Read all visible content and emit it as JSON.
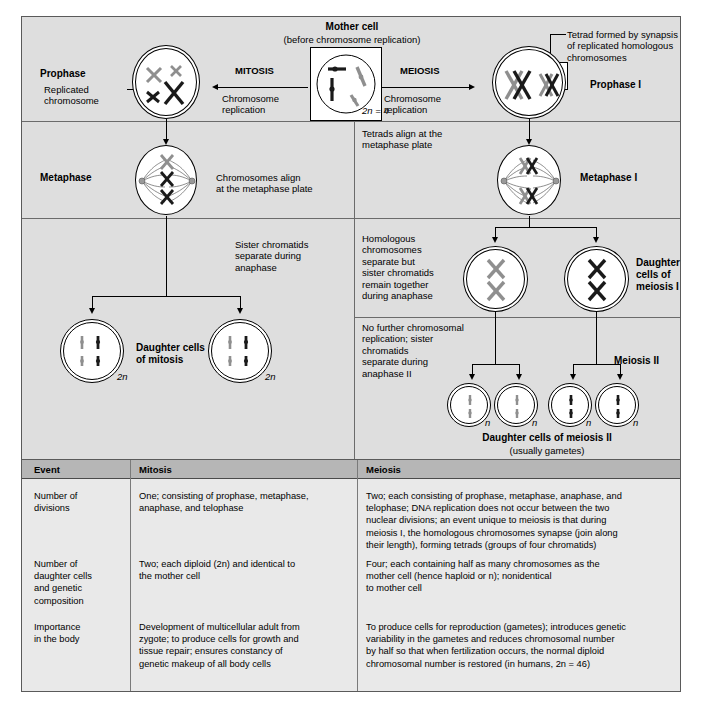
{
  "figure": {
    "mother_cell": {
      "title": "Mother cell",
      "subtitle": "(before chromosome replication)",
      "ploidy": "2n = 4"
    },
    "mitosis_branch": {
      "arrow_label": "MITOSIS",
      "sub_label": "Chromosome\nreplication"
    },
    "meiosis_branch": {
      "arrow_label": "MEIOSIS",
      "sub_label": "Chromosome\nreplication"
    },
    "row1": {
      "left_stage": "Prophase",
      "left_callout": "Replicated\nchromosome",
      "right_stage": "Prophase I",
      "right_callout": "Tetrad formed by synapsis\nof replicated homologous\nchromosomes"
    },
    "row2": {
      "left_stage": "Metaphase",
      "left_note": "Chromosomes align\nat the metaphase plate",
      "right_note": "Tetrads align at the\nmetaphase plate",
      "right_stage": "Metaphase I"
    },
    "row3": {
      "left_note": "Sister chromatids\nseparate during\nanaphase",
      "left_result": "Daughter cells\nof mitosis",
      "left_ploidy_a": "2n",
      "left_ploidy_b": "2n",
      "right_note": "Homologous\nchromosomes\nseparate but\nsister chromatids\nremain together\nduring anaphase",
      "right_result": "Daughter\ncells of\nmeiosis I"
    },
    "row4": {
      "right_note": "No further chromosomal\nreplication; sister\nchromatids\nseparate during\nanaphase II",
      "right_stage": "Meiosis II",
      "result_title": "Daughter cells of meiosis II",
      "result_subtitle": "(usually gametes)",
      "ploidies": [
        "n",
        "n",
        "n",
        "n"
      ]
    }
  },
  "table": {
    "headers": [
      "Event",
      "Mitosis",
      "Meiosis"
    ],
    "rows": [
      {
        "event": "Number of\ndivisions",
        "mitosis": "One; consisting of prophase, metaphase,\nanaphase, and telophase",
        "meiosis": "Two; each consisting of prophase, metaphase, anaphase, and\ntelophase; DNA replication does not occur between the two\nnuclear divisions; an event unique to meiosis is that during\nmeiosis I, the homologous chromosomes synapse (join along\ntheir length), forming tetrads (groups of four chromatids)"
      },
      {
        "event": "Number of\ndaughter cells\nand genetic\ncomposition",
        "mitosis": "Two; each diploid (2n) and identical to\nthe mother cell",
        "meiosis": "Four; each containing half as many chromosomes as the\nmother cell (hence haploid or n); nonidentical\nto mother cell"
      },
      {
        "event": "Importance\nin the body",
        "mitosis": "Development of multicellular adult from\nzygote; to produce cells for growth and\ntissue repair; ensures constancy of\ngenetic makeup of all body cells",
        "meiosis": "To produce cells for reproduction (gametes); introduces genetic\nvariability in the gametes and reduces chromosomal number\nby half so that when fertilization occurs, the normal diploid\nchromosomal number is restored (in humans, 2n = 46)"
      }
    ]
  },
  "colors": {
    "figure_bg": "#dedede",
    "table_bg": "#e9e9e9",
    "table_header_bg": "#b6b6b6",
    "border": "#5a5a5a",
    "chromosome_dark": "#1a1a1a",
    "chromosome_light": "#8f8f8f"
  }
}
